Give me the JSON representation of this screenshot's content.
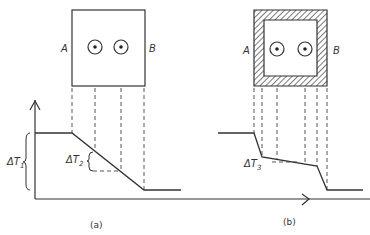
{
  "panels": [
    {
      "id": "a",
      "caption": "(a)",
      "left_label": "A",
      "right_label": "B",
      "wall": "plain",
      "delta_labels": [
        {
          "symbol": "ΔT",
          "subscript": "1"
        },
        {
          "symbol": "ΔT",
          "subscript": "2"
        }
      ]
    },
    {
      "id": "b",
      "caption": "(b)",
      "left_label": "A",
      "right_label": "B",
      "wall": "hatched",
      "delta_labels": [
        {
          "symbol": "ΔT",
          "subscript": "3"
        }
      ]
    }
  ],
  "colors": {
    "stroke": "#333333",
    "background": "#ffffff"
  }
}
